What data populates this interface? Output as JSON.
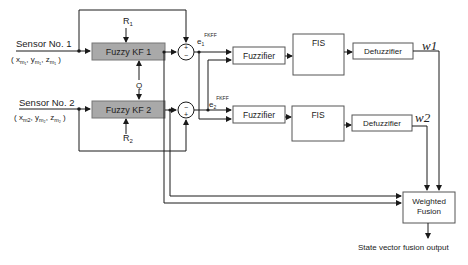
{
  "diagram": {
    "sensors": [
      {
        "label": "Sensor No. 1",
        "coords": "( x",
        "sub_x": "m1",
        "sub_y": "m1",
        "sub_z": "m1"
      },
      {
        "label": "Sensor No. 2",
        "coords": "( x",
        "sub_x": "m2",
        "sub_y": "m2",
        "sub_z": "m2"
      }
    ],
    "sensor1_coords_text": "(x",
    "blocks": {
      "kf1": "Fuzzy KF 1",
      "kf2": "Fuzzy KF 2",
      "fuzzifier1": "Fuzzifier",
      "fuzzifier2": "Fuzzifier",
      "fis1": "FIS",
      "fis2": "FIS",
      "defuzzifier1": "Defuzzifier",
      "defuzzifier2": "Defuzzifier",
      "fusion_line1": "Weighted",
      "fusion_line2": "Fusion"
    },
    "signals": {
      "r1": "R",
      "r1_sub": "1",
      "r2": "R",
      "r2_sub": "2",
      "q": "Q",
      "e1": "e",
      "e1_sub": "1",
      "e1_sup": "FKFF",
      "e2": "e",
      "e2_sub": "2",
      "e2_sup": "FKFF",
      "w1": "w1",
      "w2": "w2",
      "plus": "+",
      "minus": "−"
    },
    "output_label": "State vector fusion output",
    "colors": {
      "kf_fill": "#a9a9a9",
      "line": "#1a1a1a",
      "box_stroke": "#555555"
    }
  }
}
